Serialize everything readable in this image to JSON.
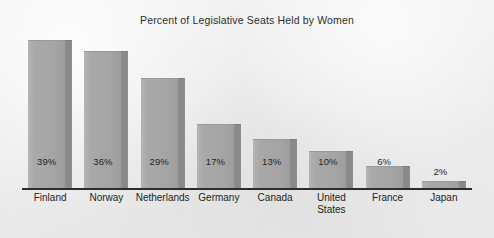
{
  "chart_data": {
    "type": "bar",
    "title": "Percent of Legislative Seats Held by Women",
    "xlabel": "",
    "ylabel": "",
    "ylim": [
      0,
      42
    ],
    "grid": false,
    "legend": "none",
    "categories": [
      "Finland",
      "Norway",
      "Netherlands",
      "Germany",
      "Canada",
      "United\nStates",
      "France",
      "Japan"
    ],
    "values": [
      39,
      36,
      29,
      17,
      13,
      10,
      6,
      2
    ],
    "value_labels": [
      "39%",
      "36%",
      "29%",
      "17%",
      "13%",
      "10%",
      "6%",
      "2%"
    ],
    "label_placement": [
      "inside",
      "inside",
      "inside",
      "inside",
      "inside",
      "inside",
      "inside",
      "outside"
    ],
    "bar_face_color": "#a9a9a9",
    "bar_shadow_color": "#8a8a8a",
    "axis_color": "#2d2d2d",
    "background_color": "#ededed",
    "title_color": "#2e2e2e"
  },
  "figure": {
    "title": "Percent of Legislative Seats Held by Women"
  }
}
